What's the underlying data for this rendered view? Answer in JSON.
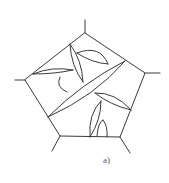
{
  "figure": {
    "caption": "a)",
    "line_color": "#3a3a3a",
    "background": "#ffffff"
  }
}
